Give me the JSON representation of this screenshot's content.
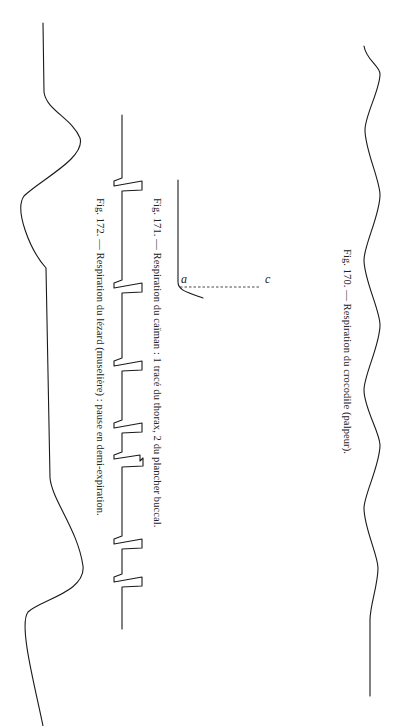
{
  "page": {
    "orientation": "rotated-90-clockwise",
    "figures": [
      {
        "id": "fig-170",
        "number": "Fig. 170.",
        "caption": "Fig. 170. — Respiration du crocodile (palpeur).",
        "trace_description": "regular wavy respiration trace"
      },
      {
        "id": "fig-171",
        "number": "Fig. 171.",
        "caption": "Fig. 171. — Respiration du caïman : 1 tracé du thorax, 2 du plancher buccal.",
        "labels": [
          "a",
          "c"
        ],
        "trace_description": "step trace with dashed reference line"
      },
      {
        "id": "fig-172",
        "number": "Fig. 172.",
        "caption": "Fig. 172. — Respiration du lézard (muselière) : pause en demi-expiration.",
        "trace_description": "baseline with periodic sharp spikes"
      }
    ],
    "left_trace_description": "large slow undulating trace"
  }
}
